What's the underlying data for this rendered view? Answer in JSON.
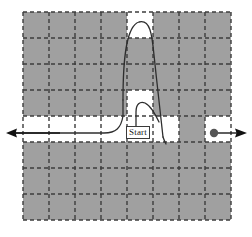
{
  "figure": {
    "type": "grid-maze-trajectory-diagram",
    "background_color": "#ffffff"
  },
  "grid": {
    "origin_x": 23,
    "origin_y": 12,
    "cell_size": 26,
    "columns": 8,
    "rows": 8,
    "filled_color": "#a0a0a0",
    "free_color": "#ffffff",
    "line_color": "#3c3c3c",
    "line_style": "dashed",
    "line_width": 1.4,
    "dash_pattern": "4 3",
    "free_cells": [
      {
        "col": 4,
        "row": 0
      },
      {
        "col": 4,
        "row": 3
      },
      {
        "col": 0,
        "row": 4
      },
      {
        "col": 1,
        "row": 4
      },
      {
        "col": 2,
        "row": 4
      },
      {
        "col": 3,
        "row": 4
      },
      {
        "col": 4,
        "row": 4
      },
      {
        "col": 5,
        "row": 4
      },
      {
        "col": 7,
        "row": 4
      }
    ]
  },
  "markers": {
    "start": {
      "label": "Start",
      "x": 126,
      "y": 126,
      "cell_col": 4,
      "cell_row": 4
    },
    "goal_dot": {
      "name": "goal-dot",
      "cx": 214,
      "cy": 133,
      "r": 4.2,
      "color": "#555555"
    }
  },
  "arrows": {
    "left_arrow": {
      "name": "left-corridor-arrow",
      "from_x": 60,
      "to_x": 8,
      "y": 133,
      "direction": "left",
      "color": "#1a1a1a"
    },
    "right_arrow": {
      "name": "right-corridor-arrow",
      "from_x": 218,
      "to_x": 246,
      "y": 133,
      "direction": "right",
      "color": "#1a1a1a"
    }
  },
  "trajectories": {
    "stroke_color": "#2e2e2e",
    "stroke_width": 1.3,
    "paths": [
      {
        "name": "corridor-entry-path",
        "description": "horizontal corridor line from left arrow curving up into the start cell",
        "d": "M 14 133 L 104 133 C 116 133 121 128 123 116 L 123 100"
      },
      {
        "name": "large-loop-path",
        "description": "tall loop rising from start cell up to the top free cell and descending past the corridor",
        "d": "M 123 100 C 123 60 126 26 139 22 C 150 19 152 34 154 55 C 157 84 161 118 163 137"
      },
      {
        "name": "large-loop-descent-tail",
        "description": "lower tail of the large loop ending just below the corridor row",
        "d": "M 163 137 C 164 140 165 142 166 144"
      },
      {
        "name": "small-loop-path",
        "description": "small loop near the start label rising out of the free cell above start",
        "d": "M 136 138 L 136 112 C 136 104 140 101 145 103 C 151 106 155 114 159 122"
      }
    ]
  },
  "labels": {
    "start_text": "Start"
  }
}
